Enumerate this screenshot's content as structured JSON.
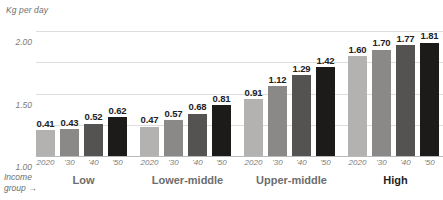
{
  "chart_data": {
    "type": "bar",
    "title": "",
    "subtitle": "",
    "ylabel": "Kg per day",
    "xlabel": "Income group",
    "xlabel_arrow": "→",
    "ylim": [
      0,
      2.0
    ],
    "yticks": [
      "0",
      "0.50",
      "1.00",
      "1.50",
      "2.00"
    ],
    "ytick_values": [
      0,
      0.5,
      1.0,
      1.5,
      2.0
    ],
    "grid": true,
    "grid_axis": "y",
    "legend": "none",
    "categories": [
      "Low",
      "Lower-middle",
      "Upper-middle",
      "High"
    ],
    "series_labels": [
      "2020",
      "'30",
      "'40",
      "'50"
    ],
    "series": [
      {
        "name": "2020",
        "values": [
          0.41,
          0.47,
          0.91,
          1.6
        ],
        "color": "#b3b2b0"
      },
      {
        "name": "'30",
        "values": [
          0.43,
          0.57,
          1.12,
          1.7
        ],
        "color": "#8a8987"
      },
      {
        "name": "'40",
        "values": [
          0.52,
          0.68,
          1.29,
          1.77
        ],
        "color": "#545351"
      },
      {
        "name": "'50",
        "values": [
          0.62,
          0.81,
          1.42,
          1.81
        ],
        "color": "#1c1b1a"
      }
    ],
    "groups": [
      {
        "label": "Low",
        "emphasis": false,
        "bars": [
          {
            "tick": "2020",
            "value": 0.41,
            "label": "0.41",
            "color": "#b3b2b0"
          },
          {
            "tick": "'30",
            "value": 0.43,
            "label": "0.43",
            "color": "#8a8987"
          },
          {
            "tick": "'40",
            "value": 0.52,
            "label": "0.52",
            "color": "#545351"
          },
          {
            "tick": "'50",
            "value": 0.62,
            "label": "0.62",
            "color": "#1c1b1a"
          }
        ]
      },
      {
        "label": "Lower-middle",
        "emphasis": false,
        "bars": [
          {
            "tick": "2020",
            "value": 0.47,
            "label": "0.47",
            "color": "#b3b2b0"
          },
          {
            "tick": "'30",
            "value": 0.57,
            "label": "0.57",
            "color": "#8a8987"
          },
          {
            "tick": "'40",
            "value": 0.68,
            "label": "0.68",
            "color": "#545351"
          },
          {
            "tick": "'50",
            "value": 0.81,
            "label": "0.81",
            "color": "#1c1b1a"
          }
        ]
      },
      {
        "label": "Upper-middle",
        "emphasis": false,
        "bars": [
          {
            "tick": "2020",
            "value": 0.91,
            "label": "0.91",
            "color": "#b3b2b0"
          },
          {
            "tick": "'30",
            "value": 1.12,
            "label": "1.12",
            "color": "#8a8987"
          },
          {
            "tick": "'40",
            "value": 1.29,
            "label": "1.29",
            "color": "#545351"
          },
          {
            "tick": "'50",
            "value": 1.42,
            "label": "1.42",
            "color": "#1c1b1a"
          }
        ]
      },
      {
        "label": "High",
        "emphasis": true,
        "bars": [
          {
            "tick": "2020",
            "value": 1.6,
            "label": "1.60",
            "color": "#b3b2b0"
          },
          {
            "tick": "'30",
            "value": 1.7,
            "label": "1.70",
            "color": "#8a8987"
          },
          {
            "tick": "'40",
            "value": 1.77,
            "label": "1.77",
            "color": "#545351"
          },
          {
            "tick": "'50",
            "value": 1.81,
            "label": "1.81",
            "color": "#1c1b1a"
          }
        ]
      }
    ]
  },
  "layout": {
    "plot_left": 36,
    "plot_width": 407,
    "plot_top": 20,
    "baseline_y": 136,
    "px_per_unit": 62.5,
    "group_width": 95,
    "group_gap": 9,
    "bar_width": 19,
    "bar_gap": 5
  }
}
